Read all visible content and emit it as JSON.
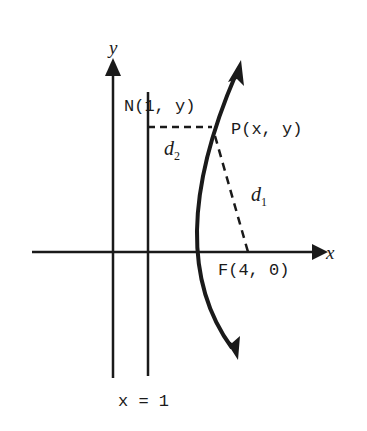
{
  "diagram": {
    "type": "parabola-focus-directrix",
    "axes": {
      "x_label": "x",
      "y_label": "y"
    },
    "directrix": {
      "label": "x = 1"
    },
    "points": {
      "N": {
        "label": "N(1, y)"
      },
      "P": {
        "label": "P(x, y)"
      },
      "F": {
        "label": "F(4, 0)"
      }
    },
    "distances": {
      "d1": {
        "name": "d",
        "sub": "1"
      },
      "d2": {
        "name": "d",
        "sub": "2"
      }
    },
    "colors": {
      "stroke": "#1a1a1a",
      "background": "#ffffff"
    }
  }
}
